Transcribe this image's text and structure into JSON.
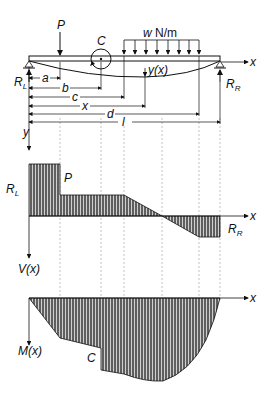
{
  "beam": {
    "labels": {
      "point_load": "P",
      "couple": "C",
      "distributed_load_w": "w",
      "distributed_load_units": "N/m",
      "deflection": "y(x)",
      "x_axis": "x",
      "y_axis": "y",
      "left_reaction": "R",
      "left_reaction_sub": "L",
      "right_reaction": "R",
      "right_reaction_sub": "R"
    },
    "dimensions": [
      "a",
      "b",
      "c",
      "x",
      "d",
      "l"
    ]
  },
  "shear_diagram": {
    "labels": {
      "left_reaction": "R",
      "left_reaction_sub": "L",
      "point_load": "P",
      "x_axis": "x",
      "right_reaction": "R",
      "right_reaction_sub": "R",
      "y_axis": "V(x)"
    }
  },
  "moment_diagram": {
    "labels": {
      "couple": "C",
      "x_axis": "x",
      "y_axis": "M(x)"
    }
  },
  "colors": {
    "ink": "#111111",
    "fill": "#6e6e6e",
    "hatch": "#d8d8d8",
    "grid": "#9a9a9a"
  }
}
